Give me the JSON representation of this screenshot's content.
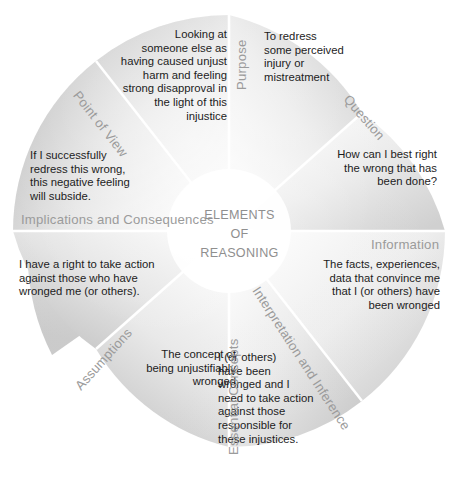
{
  "diagram": {
    "title": "ELEMENTS\nOF\nREASONING",
    "type": "circular-wheel",
    "segment_count": 8,
    "colors": {
      "segment_fill_light": "#f2f2f2",
      "segment_fill_mid": "#dcdcdc",
      "segment_fill_dark": "#c2c2c2",
      "divider": "#ffffff",
      "label_text": "#9b9b9b",
      "body_text": "#1c1c1c",
      "center_text": "#8f8f8f",
      "background": "#ffffff"
    },
    "segments": [
      {
        "id": "point-of-view",
        "label": "Point of View",
        "text": "Looking at\nsomeone else as\nhaving caused unjust\nharm and feeling\nstrong disapproval in\nthe light of this\ninjustice"
      },
      {
        "id": "purpose",
        "label": "Purpose",
        "text": "To redress\nsome perceived\ninjury or\nmistreatment"
      },
      {
        "id": "question",
        "label": "Question",
        "text": "How can I best right\nthe wrong that has\nbeen done?"
      },
      {
        "id": "information",
        "label": "Information",
        "text": "The facts, experiences,\ndata that convince me\nthat I (or others) have\nbeen wronged"
      },
      {
        "id": "interpretation-and-inference",
        "label": "Interpretation and Inference",
        "text": "I (or others)\nhave been\nwronged and I\nneed to take action\nagainst those\nresponsible for\nthese injustices."
      },
      {
        "id": "essential-concepts",
        "label": "Essential Concepts",
        "text": "The concept of\nbeing unjustifiably\nwronged"
      },
      {
        "id": "assumptions",
        "label": "Assumptions",
        "text": "I have a right to take action\nagainst those who have\nwronged me (or others)."
      },
      {
        "id": "implications-and-consequences",
        "label": "Implications and Consequences",
        "text": "If I successfully\nredress this wrong,\nthis negative feeling\nwill subside."
      }
    ]
  }
}
